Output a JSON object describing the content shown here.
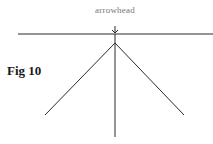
{
  "figure": {
    "label": "Fig 10",
    "annotation": "arrowhead"
  },
  "colors": {
    "line": "#2a2a2a",
    "annotation_text": "#777777",
    "label_text": "#1a1a1a",
    "background": "#ffffff"
  },
  "geometry": {
    "horizontal_line": {
      "x1": 18,
      "y1": 34,
      "x2": 213,
      "y2": 34
    },
    "apex": {
      "x": 115,
      "y": 43
    },
    "left_branch_end": {
      "x": 45,
      "y": 115
    },
    "right_branch_end": {
      "x": 184,
      "y": 115
    },
    "stem_end": {
      "x": 115,
      "y": 137
    },
    "arrow": {
      "x": 115,
      "y_top": 26,
      "y_tip": 33
    }
  }
}
